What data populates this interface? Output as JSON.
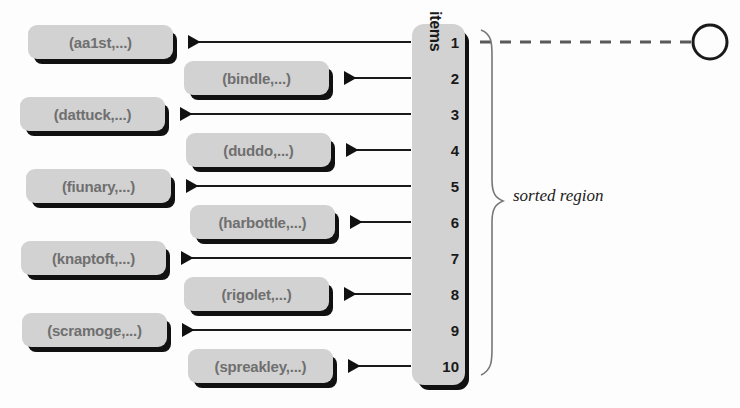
{
  "diagram": {
    "items_axis_label": "items",
    "sorted_region_label": "sorted region",
    "slot_numbers": [
      "1",
      "2",
      "3",
      "4",
      "5",
      "6",
      "7",
      "8",
      "9",
      "10"
    ],
    "records": [
      {
        "label": "(aa1st,...)",
        "slot": "1",
        "side": "left"
      },
      {
        "label": "(bindle,...)",
        "slot": "2",
        "side": "right"
      },
      {
        "label": "(dattuck,...)",
        "slot": "3",
        "side": "left"
      },
      {
        "label": "(duddo,...)",
        "slot": "4",
        "side": "right"
      },
      {
        "label": "(fiunary,...)",
        "slot": "5",
        "side": "left"
      },
      {
        "label": "(harbottle,...)",
        "slot": "6",
        "side": "right"
      },
      {
        "label": "(knaptoft,...)",
        "slot": "7",
        "side": "left"
      },
      {
        "label": "(rigolet,...)",
        "slot": "8",
        "side": "right"
      },
      {
        "label": "(scramoge,...)",
        "slot": "9",
        "side": "left"
      },
      {
        "label": "(spreakley,...)",
        "slot": "10",
        "side": "right"
      }
    ],
    "free_pointer": {
      "from_slot": "1",
      "style": "dashed",
      "target": "empty-circle"
    },
    "colors": {
      "record_fill": "#d2d2d2",
      "record_text": "#6f6f6f",
      "shadow": "#111111",
      "line": "#1a1a1a",
      "background": "#fdfdfd"
    }
  }
}
